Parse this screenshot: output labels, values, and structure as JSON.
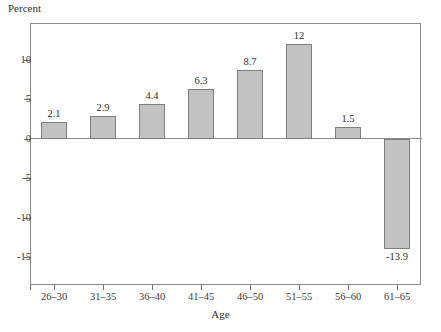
{
  "chart_data": {
    "type": "bar",
    "title": "",
    "xlabel": "Age",
    "ylabel": "Percent",
    "categories": [
      "26–30",
      "31–35",
      "36–40",
      "41–45",
      "46–50",
      "51–55",
      "56–60",
      "61–65"
    ],
    "values": [
      2.1,
      2.9,
      4.4,
      6.3,
      8.7,
      12,
      1.5,
      -13.9
    ],
    "value_labels": [
      "2.1",
      "2.9",
      "4.4",
      "6.3",
      "8.7",
      "12",
      "1.5",
      "-13.9"
    ],
    "ylim": [
      -17.5,
      14.8
    ],
    "yticks": [
      10,
      5,
      0,
      -5,
      -10,
      -15
    ],
    "ytick_labels": [
      "10",
      "5",
      "0",
      "-5",
      "-10",
      "-15"
    ],
    "grid": false,
    "legend": false,
    "bar_color": "#c2c2c2",
    "bar_border_color": "#7e7e7e",
    "axis_color": "#8b8b8b",
    "text_color": "#3a3a3a"
  }
}
